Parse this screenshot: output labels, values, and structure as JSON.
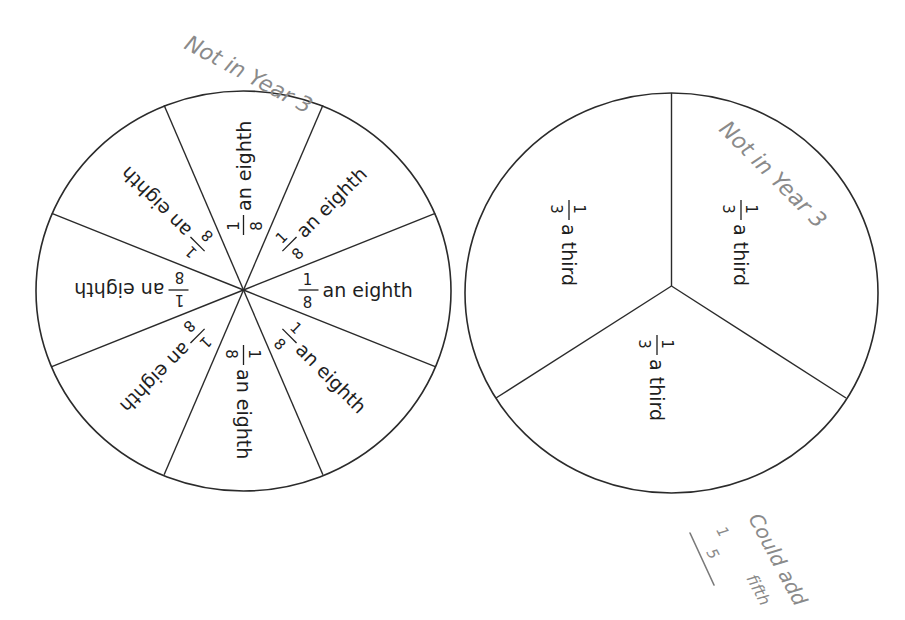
{
  "colors": {
    "outline": "#2b2b2b",
    "text": "#1e1e1e",
    "handwriting": "#8a8a8a",
    "background": "#ffffff"
  },
  "left_circle": {
    "name": "eighths-circle",
    "slices": 8,
    "fraction": {
      "numerator": "1",
      "denominator": "8"
    },
    "label": "an eighth"
  },
  "right_circle": {
    "name": "thirds-circle",
    "slices": 3,
    "fraction": {
      "numerator": "1",
      "denominator": "3"
    },
    "label": "a third"
  },
  "annotations": {
    "left_note": "Not in Year 3",
    "right_note": "Not in Year 3",
    "bottom_note": "Could add",
    "bottom_note_2": "fifth",
    "bottom_fraction": {
      "numerator": "1",
      "denominator": "5"
    }
  }
}
